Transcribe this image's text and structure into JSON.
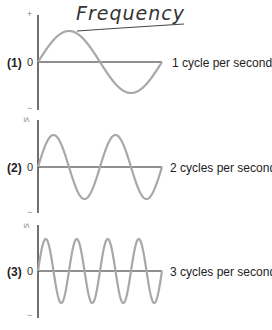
{
  "title": "Frequency",
  "axis": {
    "plus_symbol": "+",
    "minus_symbol": "−",
    "zero_label": "0",
    "marker_symbol": "≤"
  },
  "panels": [
    {
      "label": "(1)",
      "zero": "0",
      "caption": "1 cycle per second",
      "cycles": 1
    },
    {
      "label": "(2)",
      "zero": "0",
      "caption": "2 cycles per second",
      "cycles": 2
    },
    {
      "label": "(3)",
      "zero": "0",
      "caption": "3 cycles per second",
      "cycles": 4
    }
  ],
  "colors": {
    "axis": "#222222",
    "wave": "#a8a8a8",
    "ink": "#333333"
  }
}
